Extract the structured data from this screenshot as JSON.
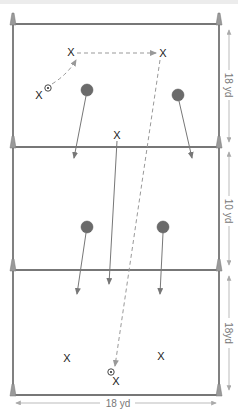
{
  "diagram": {
    "type": "soccer drill field diagram",
    "colors": {
      "field_line": "#4a4a4a",
      "cone": "#9a9a9a",
      "defender": "#6b6b6b",
      "run_arrow": "#777777",
      "pass_arrow": "#999999",
      "dimension": "#999999"
    },
    "dimensions": {
      "zone_top": "18 yd",
      "zone_middle": "10 yd",
      "zone_bottom": "18yd",
      "width": "18 yd"
    },
    "zones": [
      {
        "name": "top",
        "label": "18 yd"
      },
      {
        "name": "middle",
        "label": "10 yd"
      },
      {
        "name": "bottom",
        "label": "18yd"
      }
    ],
    "players": {
      "symbol": "X",
      "top_zone": [
        {
          "id": "p1",
          "label": "X",
          "has_ball": true
        },
        {
          "id": "p2",
          "label": "X"
        },
        {
          "id": "p3",
          "label": "X"
        }
      ],
      "middle_line": [
        {
          "id": "p4",
          "label": "X"
        }
      ],
      "bottom_zone": [
        {
          "id": "p5",
          "label": "X"
        },
        {
          "id": "p6",
          "label": "X"
        },
        {
          "id": "p7",
          "label": "X",
          "has_ball": true
        }
      ]
    },
    "defenders": [
      {
        "id": "d1",
        "zone": "top"
      },
      {
        "id": "d2",
        "zone": "top"
      },
      {
        "id": "d3",
        "zone": "middle"
      },
      {
        "id": "d4",
        "zone": "middle"
      }
    ],
    "icons": {
      "ball": "soccer-ball-icon",
      "cone": "cone-icon",
      "defender": "defender-circle-icon"
    }
  }
}
